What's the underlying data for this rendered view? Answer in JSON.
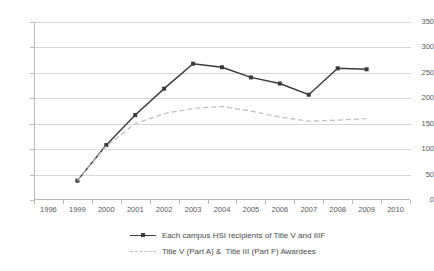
{
  "chart_data": {
    "type": "line",
    "title": "",
    "subtitle": "",
    "xlabel": "",
    "ylabel": "",
    "categories": [
      "1996",
      "1999",
      "2000",
      "2001",
      "2002",
      "2003",
      "2004",
      "2005",
      "2006",
      "2007",
      "2008",
      "2009",
      "2010"
    ],
    "ylim": [
      0,
      350
    ],
    "ytick_step": 50,
    "yticks": [
      "350",
      "300",
      "250",
      "200",
      "150",
      "100",
      "50",
      "0"
    ],
    "grid": "horizontal",
    "legend_position": "bottom-center",
    "series": [
      {
        "name": "Each campus HSI recipients of Title V and IIIF",
        "style": "solid",
        "color": "#3a3a3a",
        "marker": "square",
        "values": [
          null,
          38,
          108,
          167,
          219,
          268,
          261,
          241,
          229,
          207,
          259,
          257,
          null
        ]
      },
      {
        "name": "Title V (Part A) &  Title III (Part F) Awardees",
        "style": "dashed",
        "color": "#c2c2c2",
        "marker": "none",
        "values": [
          null,
          38,
          106,
          150,
          170,
          180,
          184,
          175,
          163,
          155,
          157,
          160,
          null
        ]
      }
    ]
  },
  "axes": {
    "y": {
      "labels": [
        "350",
        "300",
        "250",
        "200",
        "150",
        "100",
        "50",
        "0"
      ]
    },
    "x": {
      "labels": [
        "1996",
        "1999",
        "2000",
        "2001",
        "2002",
        "2003",
        "2004",
        "2005",
        "2006",
        "2007",
        "2008",
        "2009",
        "2010"
      ]
    }
  },
  "legend": {
    "items": [
      {
        "label": "Each campus HSI recipients of Title V and IIIF"
      },
      {
        "label": "Title V (Part A) &  Title III (Part F) Awardees"
      }
    ]
  },
  "colors": {
    "series_solid": "#3a3a3a",
    "series_dashed": "#c2c2c2",
    "gridline": "#d6d6d6",
    "axis": "#b8b8b8",
    "text": "#4a4a4a",
    "background": "#ffffff"
  }
}
